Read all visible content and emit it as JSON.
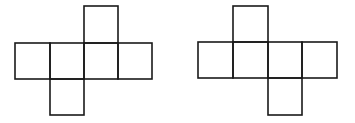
{
  "diagram": {
    "stroke_color": "#1a1a1a",
    "background": "#ffffff",
    "nets": [
      {
        "name": "net-left",
        "squares": [
          {
            "x": 15,
            "y": 43,
            "w": 35,
            "h": 36
          },
          {
            "x": 50,
            "y": 43,
            "w": 34,
            "h": 36
          },
          {
            "x": 84,
            "y": 43,
            "w": 34,
            "h": 36
          },
          {
            "x": 118,
            "y": 43,
            "w": 34,
            "h": 36
          },
          {
            "x": 84,
            "y": 6,
            "w": 34,
            "h": 37
          },
          {
            "x": 50,
            "y": 79,
            "w": 34,
            "h": 36
          }
        ]
      },
      {
        "name": "net-right",
        "squares": [
          {
            "x": 198,
            "y": 42,
            "w": 35,
            "h": 36
          },
          {
            "x": 233,
            "y": 42,
            "w": 35,
            "h": 36
          },
          {
            "x": 268,
            "y": 42,
            "w": 34,
            "h": 36
          },
          {
            "x": 302,
            "y": 42,
            "w": 35,
            "h": 36
          },
          {
            "x": 233,
            "y": 6,
            "w": 35,
            "h": 36
          },
          {
            "x": 268,
            "y": 78,
            "w": 34,
            "h": 37
          }
        ]
      }
    ]
  }
}
